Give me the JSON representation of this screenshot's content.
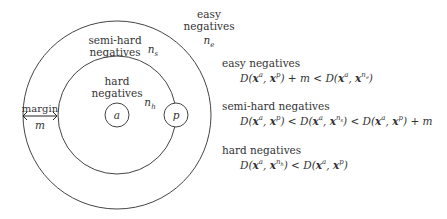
{
  "diagram": {
    "regions": {
      "easy": {
        "label_line1": "easy",
        "label_line2": "negatives",
        "symbol": "n",
        "symbol_sub": "e"
      },
      "semi_hard": {
        "label_line1": "semi-hard",
        "label_line2": "negatives",
        "symbol": "n",
        "symbol_sub": "s"
      },
      "hard": {
        "label_line1": "hard",
        "label_line2": "negatives",
        "symbol": "n",
        "symbol_sub": "h"
      }
    },
    "anchor": "a",
    "positive": "p",
    "margin": {
      "label": "margin",
      "symbol": "m"
    }
  },
  "rules": [
    {
      "title": "easy negatives",
      "equation": "D(xᵃ, xᵖ) + m < D(xᵃ, xⁿᵉ)"
    },
    {
      "title": "semi-hard negatives",
      "equation": "D(xᵃ, xᵖ) < D(xᵃ, xⁿˢ) < D(xᵃ, xᵖ) + m"
    },
    {
      "title": "hard negatives",
      "equation": "D(xᵃ, xⁿʰ) < D(xᵃ, xᵖ)"
    }
  ],
  "colors": {
    "stroke": "#333333",
    "text": "#333333",
    "background": "#ffffff"
  }
}
